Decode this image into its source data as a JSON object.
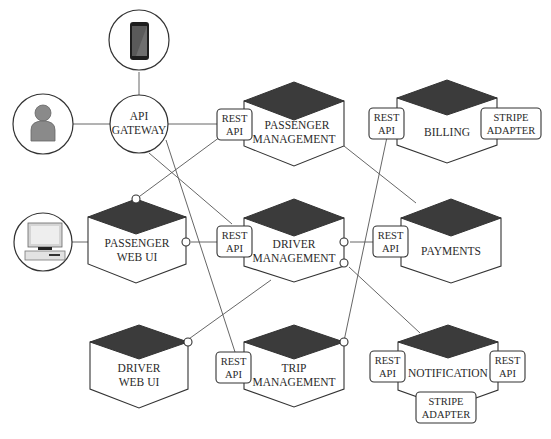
{
  "diagram": {
    "actors": {
      "mobile": {
        "icon": "smartphone-icon"
      },
      "user": {
        "icon": "user-icon"
      },
      "desktop": {
        "icon": "desktop-computer-icon"
      },
      "gateway": {
        "line1": "API",
        "line2": "GATEWAY"
      }
    },
    "services": {
      "passenger_management": {
        "line1": "PASSENGER",
        "line2": "MANAGEMENT",
        "api_line1": "REST",
        "api_line2": "API"
      },
      "billing": {
        "line1": "BILLING",
        "api_line1": "REST",
        "api_line2": "API",
        "adapter_line1": "STRIPE",
        "adapter_line2": "ADAPTER"
      },
      "passenger_web_ui": {
        "line1": "PASSENGER",
        "line2": "WEB UI"
      },
      "driver_management": {
        "line1": "DRIVER",
        "line2": "MANAGEMENT",
        "api_line1": "REST",
        "api_line2": "API"
      },
      "payments": {
        "line1": "PAYMENTS",
        "api_line1": "REST",
        "api_line2": "API"
      },
      "driver_web_ui": {
        "line1": "DRIVER",
        "line2": "WEB UI"
      },
      "trip_management": {
        "line1": "TRIP",
        "line2": "MANAGEMENT",
        "api_line1": "REST",
        "api_line2": "API"
      },
      "notification": {
        "line1": "NOTIFICATION",
        "api_left_line1": "REST",
        "api_left_line2": "API",
        "api_right_line1": "REST",
        "api_right_line2": "API",
        "adapter_line1": "STRIPE",
        "adapter_line2": "ADAPTER"
      }
    },
    "colors": {
      "hex_top": "#3b3b3b",
      "stroke": "#333333",
      "background": "#ffffff"
    }
  }
}
